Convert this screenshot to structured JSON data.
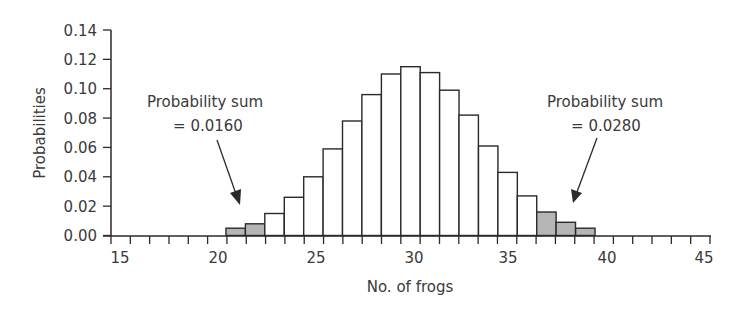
{
  "chart_data": {
    "type": "bar",
    "title": "",
    "xlabel": "No. of frogs",
    "ylabel": "Probabilities",
    "xlim": [
      15,
      45
    ],
    "ylim": [
      0,
      0.14
    ],
    "x_ticks": [
      "15",
      "20",
      "25",
      "30",
      "35",
      "40",
      "45"
    ],
    "y_ticks": [
      "0.00",
      "0.02",
      "0.04",
      "0.06",
      "0.08",
      "0.10",
      "0.12",
      "0.14"
    ],
    "grid": false,
    "legend": null,
    "categories": [
      21,
      22,
      23,
      24,
      25,
      26,
      27,
      28,
      29,
      30,
      31,
      32,
      33,
      34,
      35,
      36,
      37,
      38,
      39
    ],
    "values": [
      0.005,
      0.008,
      0.015,
      0.026,
      0.04,
      0.059,
      0.078,
      0.096,
      0.11,
      0.115,
      0.111,
      0.099,
      0.082,
      0.061,
      0.043,
      0.027,
      0.016,
      0.009,
      0.005
    ],
    "shaded": [
      true,
      true,
      false,
      false,
      false,
      false,
      false,
      false,
      false,
      false,
      false,
      false,
      false,
      false,
      false,
      false,
      true,
      true,
      true
    ],
    "annotations": [
      {
        "line1": "Probability sum",
        "line2": "= 0.0160",
        "points_to": "left tail (21–22)"
      },
      {
        "line1": "Probability sum",
        "line2": "= 0.0280",
        "points_to": "right tail (37–39)"
      }
    ]
  },
  "colors": {
    "bar_fill": "#ffffff",
    "shaded_fill": "#b5b5b5",
    "stroke": "#2a2a2a",
    "text": "#3a3a3a"
  }
}
